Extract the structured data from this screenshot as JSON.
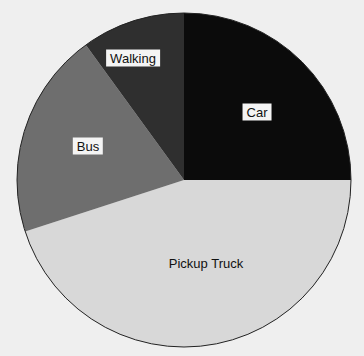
{
  "chart_data": {
    "type": "pie",
    "title": "",
    "categories": [
      "Car",
      "Pickup Truck",
      "Bus",
      "Walking"
    ],
    "values": [
      25,
      45,
      20,
      10
    ],
    "colors": [
      "#0b0b0b",
      "#d8d8d8",
      "#6e6e6e",
      "#2f2f2f"
    ],
    "start_angle": "12 o'clock",
    "direction": "clockwise",
    "legend": "none",
    "labels_inside": true
  },
  "labels": {
    "car": "Car",
    "pickup": "Pickup Truck",
    "bus": "Bus",
    "walking": "Walking"
  }
}
